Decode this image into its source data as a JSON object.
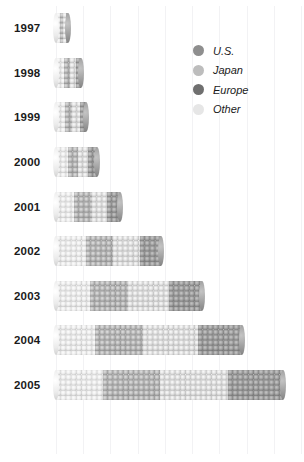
{
  "chart_data": {
    "type": "bar",
    "orientation": "horizontal",
    "stacked": true,
    "title": "",
    "xlabel": "",
    "ylabel": "",
    "grid": true,
    "legend_position": "top-right",
    "xlim": [
      0,
      450
    ],
    "axis_ticks": [
      "0",
      "50",
      "100",
      "150",
      "200",
      "250",
      "300",
      "350",
      "400",
      "450"
    ],
    "categories": [
      "1997",
      "1998",
      "1999",
      "2000",
      "2001",
      "2002",
      "2003",
      "2004",
      "2005"
    ],
    "series": [
      {
        "name": "Other",
        "color": "#ebebeb",
        "values": [
          6,
          12,
          13,
          18,
          28,
          45,
          52,
          60,
          72
        ]
      },
      {
        "name": "Japan",
        "color": "#b4b4b4",
        "values": [
          5,
          10,
          12,
          16,
          26,
          42,
          58,
          72,
          86
        ]
      },
      {
        "name": "Europe",
        "color": "#dcdcdc",
        "values": [
          4,
          9,
          11,
          15,
          24,
          40,
          62,
          84,
          104
        ]
      },
      {
        "name": "U.S.",
        "color": "#9c9c9c",
        "values": [
          3,
          7,
          9,
          13,
          20,
          33,
          50,
          66,
          83
        ]
      }
    ]
  },
  "legend": {
    "items": [
      {
        "label": "U.S.",
        "color": "#8e8e8e"
      },
      {
        "label": "Japan",
        "color": "#bdbdbd"
      },
      {
        "label": "Europe",
        "color": "#6f6f6f"
      },
      {
        "label": "Other",
        "color": "#e6e6e6"
      }
    ]
  }
}
